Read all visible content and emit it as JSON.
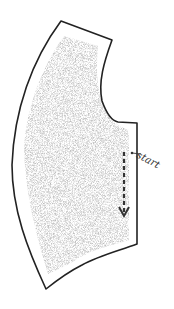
{
  "diagram": {
    "type": "sewing-pattern-piece",
    "annotations": {
      "start_label": "start"
    },
    "colors": {
      "outline": "#222222",
      "fill_stipple": "#9a9a9a",
      "arrow": "#333333"
    }
  }
}
